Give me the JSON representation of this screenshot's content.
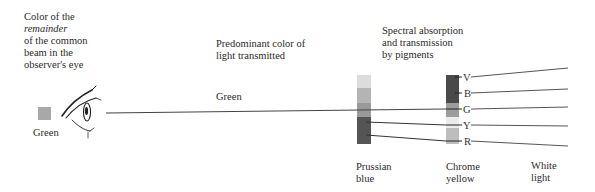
{
  "observer": {
    "heading_line1": "Color of the",
    "heading_italic": "remainder",
    "heading_line3": "of the common",
    "heading_line4": "beam in the",
    "heading_line5": "observer's eye",
    "swatch_label": "Green",
    "swatch_color": "#a8a8a8"
  },
  "transmitted": {
    "heading_line1": "Predominant color of",
    "heading_line2": "light transmitted",
    "beam_label": "Green"
  },
  "pigments": {
    "heading_line1": "Spectral absorption",
    "heading_line2": "and transmission",
    "heading_line3": "by pigments"
  },
  "prussian_blue": {
    "label_line1": "Prussian",
    "label_line2": "blue",
    "segments": [
      {
        "band": "V",
        "color": "#dcdcdc"
      },
      {
        "band": "B",
        "color": "#b4b4b4"
      },
      {
        "band": "G",
        "color": "#9a9a9a"
      },
      {
        "band": "Y",
        "color": "#555555"
      },
      {
        "band": "R",
        "color": "#555555"
      }
    ]
  },
  "chrome_yellow": {
    "label_line1": "Chrome",
    "label_line2": "yellow",
    "segments": [
      {
        "band": "V",
        "color": "#4a4a4a"
      },
      {
        "band": "B",
        "color": "#4a4a4a"
      },
      {
        "band": "G",
        "color": "#9c9c9c"
      },
      {
        "band": "Y",
        "color": "#ececec"
      },
      {
        "band": "R",
        "color": "#bdbdbd"
      }
    ]
  },
  "spectrum_bands": [
    "V",
    "B",
    "G",
    "Y",
    "R"
  ],
  "white_light": {
    "label_line1": "White",
    "label_line2": "light"
  }
}
